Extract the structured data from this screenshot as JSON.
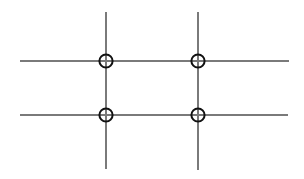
{
  "canvas": {
    "width": 304,
    "height": 179,
    "background_color": "#ffffff",
    "title": "Grid Intersection Diagram"
  },
  "style": {
    "line_color": "#7a7a7a",
    "line_width": 1.1,
    "circle_stroke_color": "#111111",
    "circle_stroke_width": 2,
    "circle_fill": "none",
    "circle_radius": 6.6
  },
  "chart_data": {
    "type": "scatter",
    "title": "",
    "subtitle": "",
    "xlabel": "",
    "ylabel": "",
    "grid": true,
    "legend_position": "none",
    "xlim": [
      0,
      304
    ],
    "ylim": [
      0,
      179
    ],
    "horizontal_lines": [
      {
        "name": "horizontal-line-top",
        "y": 61,
        "x_start": 20,
        "x_end": 289
      },
      {
        "name": "horizontal-line-bottom",
        "y": 115,
        "x_start": 20,
        "x_end": 288
      }
    ],
    "vertical_lines": [
      {
        "name": "vertical-line-left",
        "x": 106,
        "y_start": 12,
        "y_end": 169
      },
      {
        "name": "vertical-line-right",
        "x": 198,
        "y_start": 12,
        "y_end": 170
      }
    ],
    "points": [
      {
        "name": "intersection-top-left",
        "x": 106,
        "y": 61
      },
      {
        "name": "intersection-top-right",
        "x": 198,
        "y": 61
      },
      {
        "name": "intersection-bottom-left",
        "x": 106,
        "y": 115
      },
      {
        "name": "intersection-bottom-right",
        "x": 198,
        "y": 115
      }
    ],
    "point_count": 4,
    "line_count": 4
  }
}
